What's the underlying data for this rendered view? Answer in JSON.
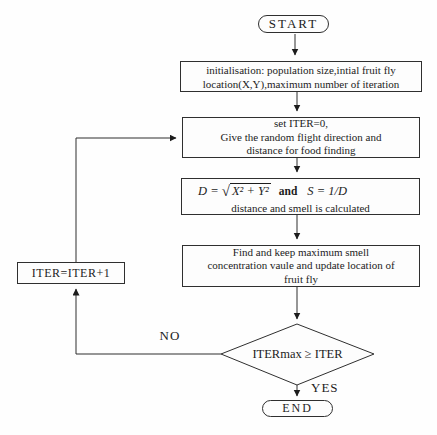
{
  "flowchart": {
    "nodes": {
      "start": {
        "label": "START"
      },
      "init": {
        "lines": [
          "initialisation: population size,intial fruit fly",
          "location(X,Y),maximum number of iteration"
        ]
      },
      "set_iter": {
        "lines": [
          "set ITER=0,",
          "Give the random flight direction and",
          "distance for food finding"
        ]
      },
      "formula": {
        "lhs": "D = ",
        "radical": "√",
        "radicand": "X² + Y²",
        "conj": "and",
        "rhs": "S = 1/D",
        "caption": "distance and smell is calculated"
      },
      "find_max": {
        "lines": [
          "Find and keep maximum smell",
          "concentration vaule and update location of",
          "fruit fly"
        ]
      },
      "iter_increment": {
        "label": "ITER=ITER+1"
      },
      "decision": {
        "label": "ITERmax ≥ ITER"
      },
      "end": {
        "label": "END"
      }
    },
    "edge_labels": {
      "no": "NO",
      "yes": "YES"
    },
    "colors": {
      "line": "#2f2f2f",
      "text": "#1c1c1c",
      "node_fill": "#fdfdfd",
      "background": "#fefefe"
    }
  }
}
